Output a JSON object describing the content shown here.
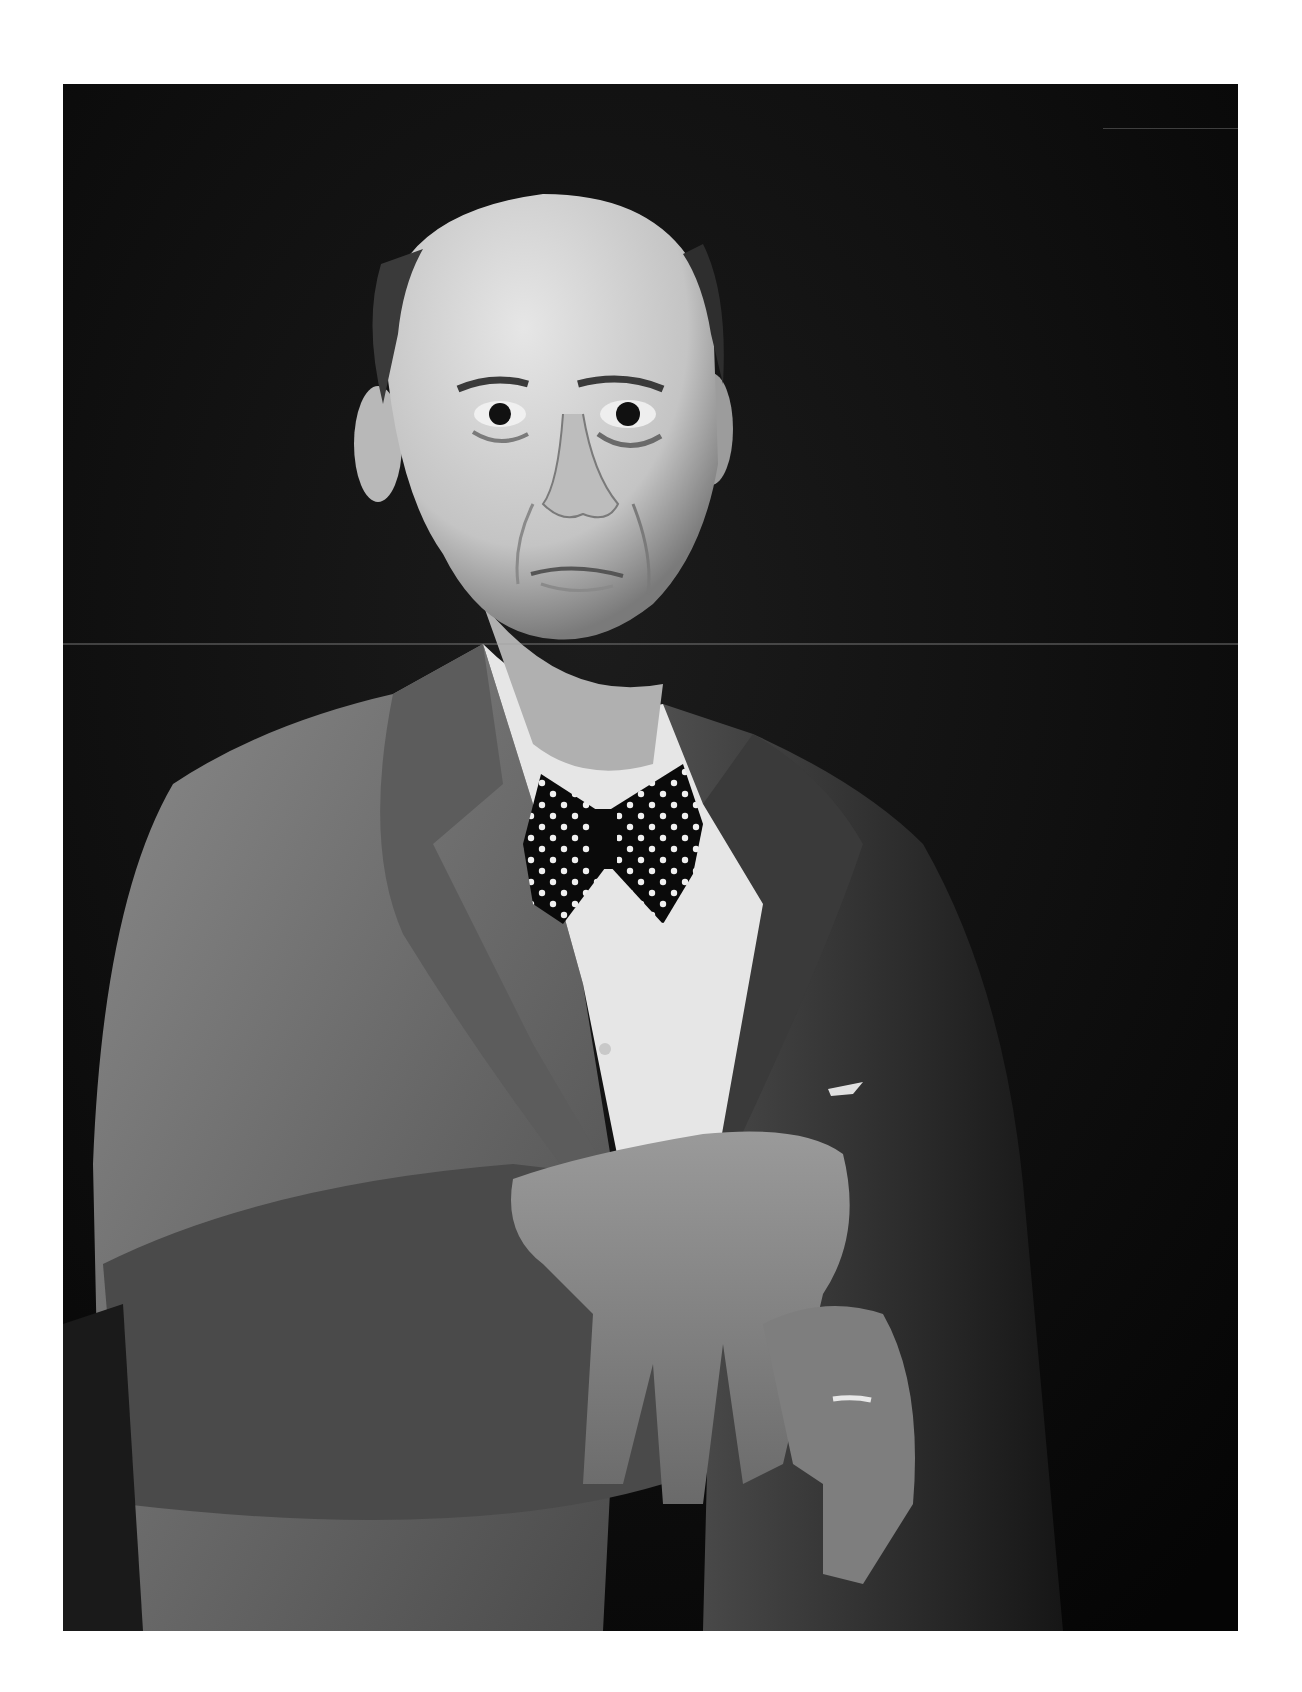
{
  "image": {
    "subject": "Black-and-white studio portrait of a bald older man in a tweed jacket, white shirt and polka-dot bow tie, hands resting crossed on a chair back",
    "palette": {
      "page_background": "#ffffff",
      "photo_background": "#0b0b0b",
      "jacket": "#6e6e6e",
      "jacket_shadow": "#2a2a2a",
      "shirt": "#e8e8e8",
      "skin": "#d6d6d6",
      "skin_shadow": "#8a8a8a",
      "bowtie": "#0a0a0a",
      "bowtie_dots": "#f2f2f2"
    },
    "features": [
      "bald head",
      "dark eyes with heavy bags",
      "polka-dot bow tie",
      "tweed jacket",
      "pocket square",
      "crossed hands",
      "wedding ring"
    ]
  }
}
